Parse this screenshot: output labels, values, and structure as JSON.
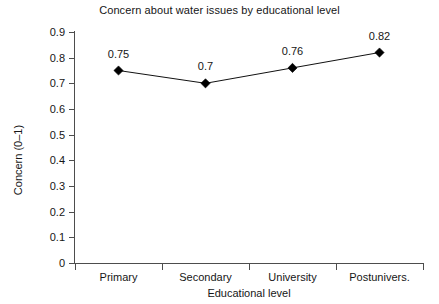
{
  "chart_data": {
    "type": "line",
    "title": "Concern about water issues by educational level",
    "xlabel": "Educational level",
    "ylabel": "Concern (0–1)",
    "categories": [
      "Primary",
      "Secondary",
      "University",
      "Postunivers."
    ],
    "values": [
      0.75,
      0.7,
      0.76,
      0.82
    ],
    "point_labels": [
      "0.75",
      "0.7",
      "0.76",
      "0.82"
    ],
    "ylim": [
      0,
      0.9
    ],
    "ytick_labels": [
      "0.9",
      "0.8",
      "0.7",
      "0.6",
      "0.5",
      "0.4",
      "0.3",
      "0.2",
      "0.1",
      "0"
    ],
    "ytick_values": [
      0.9,
      0.8,
      0.7,
      0.6,
      0.5,
      0.4,
      0.3,
      0.2,
      0.1,
      0
    ],
    "grid": false,
    "legend": false,
    "marker": "filled-diamond",
    "series_color": "#000000",
    "background_color": "#ffffff"
  }
}
